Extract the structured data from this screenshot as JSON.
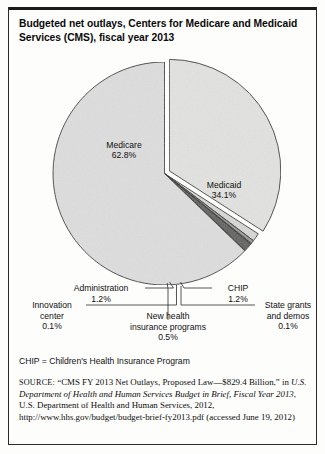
{
  "figure": {
    "title": "Budgeted net outlays, Centers for Medicare and Medicaid Services (CMS), fiscal year 2013",
    "title_line1": "Budgeted net outlays, Centers for Medicare and Medicaid",
    "title_line2": "Services (CMS), fiscal year 2013",
    "footnote": "CHIP = Children's Health Insurance Program",
    "border_color": "#2a2a2a"
  },
  "source": {
    "kicker": "SOURCE:",
    "quoted_title": "“CMS FY 2013 Net Outlays, Proposed Law—$829.4 Billion,”",
    "in_word": "in",
    "publication_italic_1": "U.S. Department of Health and Human Services Budget in Brief,",
    "publication_italic_2": "Fiscal Year 2013",
    "publisher": ", U.S. Department of Health and Human Services,",
    "year_and_url": "2012, http://www.hhs.gov/budget/budget-brief-fy2013.pdf (accessed",
    "accessed": "June 19, 2012)"
  },
  "chart_data": {
    "type": "pie",
    "title": "Budgeted net outlays, Centers for Medicare and Medicaid Services (CMS), fiscal year 2013",
    "units": "percent of total net outlays",
    "total_label": "$829.4 Billion",
    "legend": "none",
    "grid": false,
    "start_angle_deg": 0,
    "direction": "clockwise",
    "categories": [
      "Medicaid",
      "CHIP",
      "New health insurance programs",
      "State grants and demos",
      "Administration",
      "Innovation center",
      "Medicare"
    ],
    "values": [
      34.1,
      1.2,
      0.5,
      0.1,
      1.2,
      0.1,
      62.8
    ],
    "slices": [
      {
        "name": "Medicaid",
        "value": 34.1,
        "label": "Medicaid",
        "value_label": "34.1%",
        "color": "#e3e3e1",
        "exploded": true,
        "label_placement": "inside"
      },
      {
        "name": "CHIP",
        "value": 1.2,
        "label": "CHIP",
        "value_label": "1.2%",
        "color": "#d8d8d6",
        "exploded": false,
        "label_placement": "callout-right"
      },
      {
        "name": "New health insurance programs",
        "value": 0.5,
        "label_line1": "New health",
        "label_line2": "insurance programs",
        "value_label": "0.5%",
        "color": "#9a9a98",
        "exploded": false,
        "label_placement": "callout-bottom"
      },
      {
        "name": "State grants and demos",
        "value": 0.1,
        "label_line1": "State grants",
        "label_line2": "and demos",
        "value_label": "0.1%",
        "color": "#c9c9c7",
        "exploded": false,
        "label_placement": "callout-right"
      },
      {
        "name": "Administration",
        "value": 1.2,
        "label": "Administration",
        "value_label": "1.2%",
        "color": "#5e5e5c",
        "exploded": false,
        "label_placement": "callout-left"
      },
      {
        "name": "Innovation center",
        "value": 0.1,
        "label_line1": "Innovation",
        "label_line2": "center",
        "value_label": "0.1%",
        "color": "#b4b4b2",
        "exploded": false,
        "label_placement": "callout-left"
      },
      {
        "name": "Medicare",
        "value": 62.8,
        "label": "Medicare",
        "value_label": "62.8%",
        "color": "#dedede",
        "exploded": false,
        "label_placement": "inside"
      }
    ]
  }
}
